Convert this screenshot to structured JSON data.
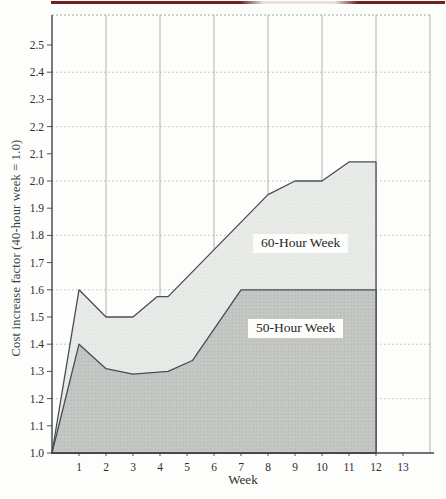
{
  "chart_data": {
    "type": "area",
    "title": "",
    "xlabel": "Week",
    "ylabel": "Cost increase factor (40-hour week = 1.0)",
    "x_tick_labels": [
      "1",
      "2",
      "3",
      "4",
      "5",
      "6",
      "7",
      "8",
      "9",
      "10",
      "11",
      "12",
      "13"
    ],
    "y_tick_labels": [
      "1.0",
      "1.1",
      "1.2",
      "1.3",
      "1.4",
      "1.5",
      "1.6",
      "1.7",
      "1.8",
      "1.9",
      "2.0",
      "2.1",
      "2.2",
      "2.3",
      "2.4",
      "2.5"
    ],
    "x_range_weeks": [
      0,
      14
    ],
    "y_range": [
      1.0,
      2.61
    ],
    "grid": {
      "vertical_at_weeks": [
        2,
        4,
        6,
        8,
        10,
        12,
        14
      ],
      "horizontal_at_values": [
        1.2,
        1.4,
        1.6,
        1.8,
        2.0,
        2.2,
        2.4
      ]
    },
    "series": [
      {
        "name": "60-Hour Week",
        "points": [
          [
            0,
            1.0
          ],
          [
            1,
            1.6
          ],
          [
            2,
            1.5
          ],
          [
            3,
            1.5
          ],
          [
            3.9,
            1.575
          ],
          [
            4.3,
            1.575
          ],
          [
            8,
            1.95
          ],
          [
            9,
            2.0
          ],
          [
            10,
            2.0
          ],
          [
            11,
            2.07
          ],
          [
            12,
            2.07
          ]
        ],
        "end_week": 12,
        "fill": "#e9ebe9",
        "dot": "#e0e3e0",
        "stroke": "#474d50"
      },
      {
        "name": "50-Hour Week",
        "points": [
          [
            0,
            1.0
          ],
          [
            1,
            1.4
          ],
          [
            2,
            1.31
          ],
          [
            3,
            1.29
          ],
          [
            4.3,
            1.3
          ],
          [
            5.2,
            1.34
          ],
          [
            7,
            1.6
          ],
          [
            12,
            1.6
          ]
        ],
        "end_week": 12,
        "fill": "#c6c8c6",
        "dot": "#b1b4b1",
        "stroke": "#474d50"
      }
    ],
    "colors": {
      "axis": "#3e4346",
      "grid_vertical": "#a4aca7",
      "grid_horizontal": "#aebcb2",
      "top_border": "#8fb2a6",
      "page_rule": "#6e2222",
      "text": "#2e2e2e"
    }
  }
}
